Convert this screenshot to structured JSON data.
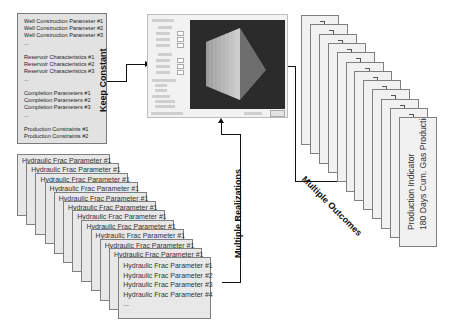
{
  "keep_constant_box": {
    "label": "Keep Constant",
    "lines": [
      "Well Construction Parameter #1",
      "Well Construction Parameter #2",
      "Well Construction Parameter #3",
      "...",
      "",
      "Reservoir Characteristics #1",
      "Reservoir Characteristics #2",
      "Reservoir Characteristics #3",
      "...",
      "",
      "Completion Parameters #1",
      "Completion Parameters #2",
      "Completion Parameters #3",
      "...",
      "",
      "Production Constraints #1",
      "Production Constraints #2"
    ]
  },
  "realizations": {
    "label": "Multiple Realizations",
    "card_count": 12,
    "back_card_title": "Hydraulic Frac Parameter #1",
    "front_card_lines": [
      "Hydraulic Frac Parameter #1",
      "Hydraulic Frac Parameter #2",
      "Hydraulic Frac Parameter #3",
      "Hydraulic Frac Parameter #4",
      "..."
    ]
  },
  "simulator": {
    "description": "Reservoir simulation software window with parameter panel and 3D fracture view"
  },
  "outcomes": {
    "label": "Multiple Outcomes",
    "card_count": 12,
    "back_card_label": "Production Indicator",
    "front_card_lines": [
      "Production Indicator",
      "180 Days Cum. Gas Production"
    ]
  }
}
